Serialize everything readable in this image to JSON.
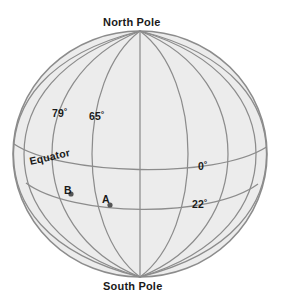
{
  "figure": {
    "name": "globe-graticule-diagram",
    "type": "globe-sphere-grid",
    "background_color": "#ffffff",
    "sphere_fill": "#ececec",
    "grid_line_color": "#8c8c8c",
    "outline_color": "#8c8c8c",
    "text_color": "#1a1a1a"
  },
  "labels": {
    "north_pole": "North Pole",
    "south_pole": "South Pole",
    "equator": "Equator",
    "lat_79": "79˚",
    "lat_65": "65˚",
    "lon_0": "0˚",
    "lon_22": "22˚",
    "point_a": "A",
    "point_b": "B"
  },
  "geometry": {
    "center_x": 140,
    "center_y": 154,
    "radius_x": 127,
    "radius_y": 123,
    "north_pole_point": [
      140,
      31
    ],
    "south_pole_point": [
      140,
      277
    ],
    "meridian_count": 9,
    "parallel_count": 2,
    "equator_y": 163,
    "parallel_22_y": 203
  },
  "annotations": {
    "points": [
      {
        "id": "A",
        "x": 110,
        "y": 205
      },
      {
        "id": "B",
        "x": 71,
        "y": 194
      }
    ]
  }
}
